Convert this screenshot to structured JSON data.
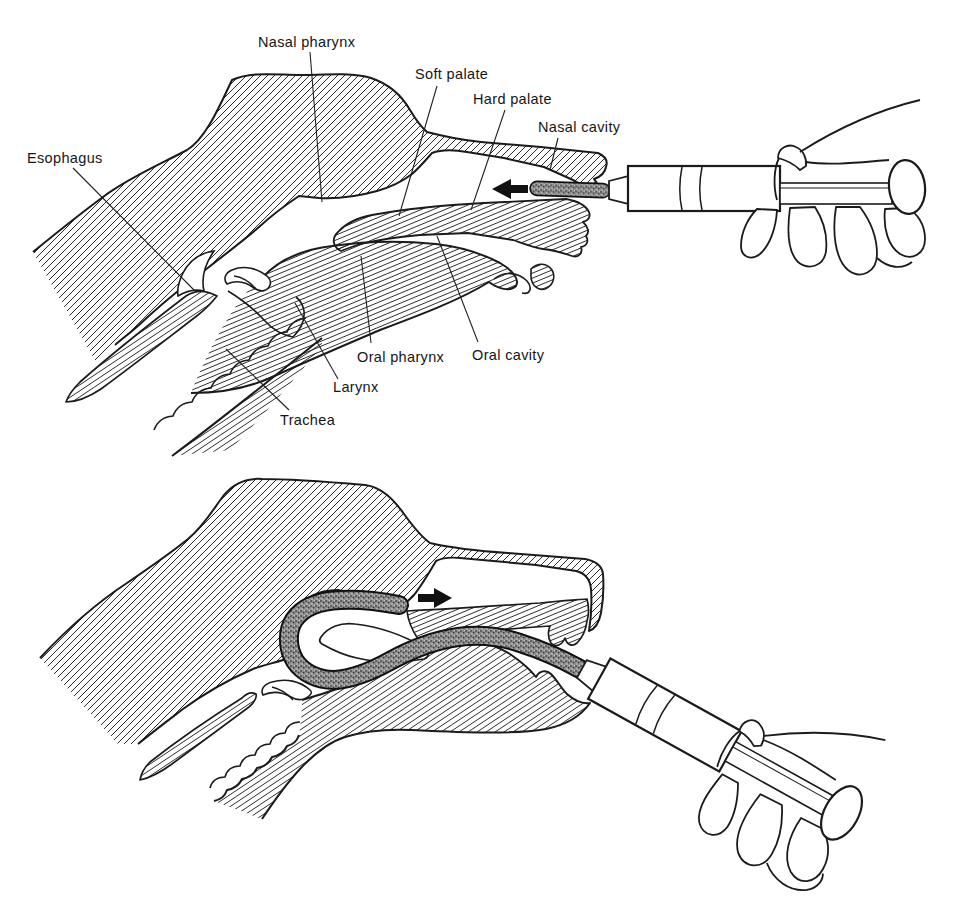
{
  "figure": {
    "background": "#ffffff",
    "ink": "#1b1b1b",
    "tube_fill": "#8f8f8f"
  },
  "top_panel": {
    "labels": {
      "nasal_pharynx": "Nasal pharynx",
      "soft_palate": "Soft palate",
      "hard_palate": "Hard palate",
      "nasal_cavity": "Nasal cavity",
      "esophagus": "Esophagus",
      "oral_pharynx": "Oral pharynx",
      "oral_cavity": "Oral cavity",
      "larynx": "Larynx",
      "trachea": "Trachea"
    },
    "arrow_direction": "left"
  },
  "bottom_panel": {
    "arrow_direction": "right"
  }
}
